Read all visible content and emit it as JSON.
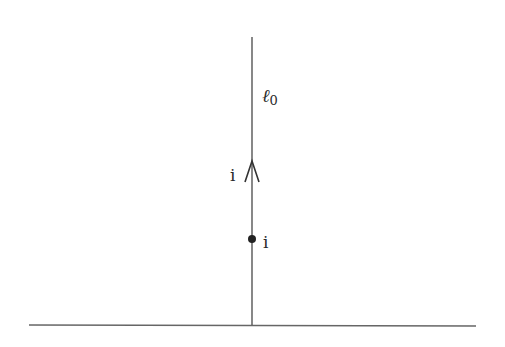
{
  "diagram": {
    "type": "contour-in-upper-half-plane",
    "line_label": "ℓ",
    "line_label_subscript": "0",
    "arrow_label": "i",
    "point_label": "i",
    "colors": {
      "stroke": "#555555",
      "text": "#2a2a2a",
      "background": "#ffffff"
    }
  }
}
